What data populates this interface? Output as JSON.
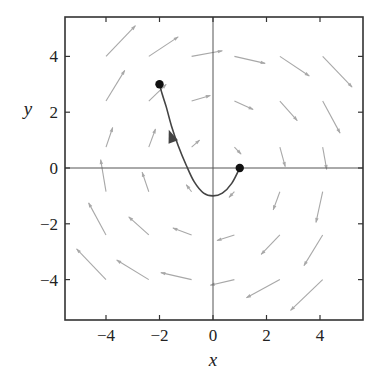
{
  "chart_data": {
    "type": "vector-field",
    "title": "",
    "xlabel": "x",
    "ylabel": "y",
    "xlim": [
      -5.4,
      5.6
    ],
    "ylim": [
      -5.4,
      5.4
    ],
    "x_ticks": [
      -4,
      -2,
      0,
      2,
      4
    ],
    "y_ticks": [
      -4,
      -2,
      0,
      2,
      4
    ],
    "x_tick_labels": [
      "−4",
      "−2",
      "0",
      "2",
      "4"
    ],
    "y_tick_labels": [
      "−4",
      "−2",
      "0",
      "2",
      "4"
    ],
    "grid": false,
    "axes_lines": true,
    "colors": {
      "frame": "#333333",
      "axes": "#555555",
      "field_arrows": "#a8a8a8",
      "trajectory": "#444444",
      "points": "#111111",
      "trajectory_arrowhead": "#444444"
    },
    "field_arrows": [
      {
        "x0": -4.0,
        "y0": 4.0,
        "x1": -2.9,
        "y1": 5.1
      },
      {
        "x0": -2.4,
        "y0": 4.0,
        "x1": -1.3,
        "y1": 4.7
      },
      {
        "x0": -0.8,
        "y0": 4.0,
        "x1": 0.35,
        "y1": 4.2
      },
      {
        "x0": 0.8,
        "y0": 4.0,
        "x1": 1.95,
        "y1": 3.75
      },
      {
        "x0": 2.5,
        "y0": 4.0,
        "x1": 3.6,
        "y1": 3.3
      },
      {
        "x0": 4.1,
        "y0": 4.0,
        "x1": 5.2,
        "y1": 2.9
      },
      {
        "x0": -4.0,
        "y0": 2.4,
        "x1": -3.3,
        "y1": 3.5
      },
      {
        "x0": -2.4,
        "y0": 2.4,
        "x1": -1.75,
        "y1": 3.0
      },
      {
        "x0": -0.8,
        "y0": 2.4,
        "x1": -0.1,
        "y1": 2.6
      },
      {
        "x0": 0.8,
        "y0": 2.4,
        "x1": 1.5,
        "y1": 2.1
      },
      {
        "x0": 2.5,
        "y0": 2.4,
        "x1": 3.15,
        "y1": 1.7
      },
      {
        "x0": 4.1,
        "y0": 2.4,
        "x1": 4.75,
        "y1": 1.25
      },
      {
        "x0": -4.0,
        "y0": 0.75,
        "x1": -3.75,
        "y1": 1.45
      },
      {
        "x0": -2.4,
        "y0": 0.75,
        "x1": -2.15,
        "y1": 1.4
      },
      {
        "x0": -0.8,
        "y0": 0.75,
        "x1": -0.5,
        "y1": 1.0
      },
      {
        "x0": 0.8,
        "y0": 0.75,
        "x1": 1.05,
        "y1": 0.5
      },
      {
        "x0": 2.5,
        "y0": 0.75,
        "x1": 2.7,
        "y1": 0.05
      },
      {
        "x0": 4.1,
        "y0": 0.75,
        "x1": 4.25,
        "y1": -0.05
      },
      {
        "x0": -4.0,
        "y0": -0.85,
        "x1": -4.2,
        "y1": 0.3
      },
      {
        "x0": -2.4,
        "y0": -0.85,
        "x1": -2.65,
        "y1": -0.15
      },
      {
        "x0": -0.8,
        "y0": -0.85,
        "x1": -1.0,
        "y1": -0.6
      },
      {
        "x0": 0.8,
        "y0": -0.85,
        "x1": 0.6,
        "y1": -1.05
      },
      {
        "x0": 2.5,
        "y0": -0.85,
        "x1": 2.25,
        "y1": -1.5
      },
      {
        "x0": 4.1,
        "y0": -0.85,
        "x1": 3.85,
        "y1": -1.95
      },
      {
        "x0": -4.0,
        "y0": -2.4,
        "x1": -4.65,
        "y1": -1.25
      },
      {
        "x0": -2.4,
        "y0": -2.4,
        "x1": -3.15,
        "y1": -1.75
      },
      {
        "x0": -0.8,
        "y0": -2.4,
        "x1": -1.5,
        "y1": -2.15
      },
      {
        "x0": 0.8,
        "y0": -2.4,
        "x1": 0.15,
        "y1": -2.6
      },
      {
        "x0": 2.5,
        "y0": -2.4,
        "x1": 1.8,
        "y1": -3.1
      },
      {
        "x0": 4.1,
        "y0": -2.4,
        "x1": 3.4,
        "y1": -3.5
      },
      {
        "x0": -4.0,
        "y0": -4.0,
        "x1": -5.1,
        "y1": -2.9
      },
      {
        "x0": -2.4,
        "y0": -4.0,
        "x1": -3.6,
        "y1": -3.3
      },
      {
        "x0": -0.8,
        "y0": -4.0,
        "x1": -1.95,
        "y1": -3.75
      },
      {
        "x0": 0.8,
        "y0": -4.0,
        "x1": -0.1,
        "y1": -4.2
      },
      {
        "x0": 2.5,
        "y0": -4.0,
        "x1": 1.25,
        "y1": -4.65
      },
      {
        "x0": 4.1,
        "y0": -4.0,
        "x1": 2.9,
        "y1": -5.1
      }
    ],
    "trajectory": {
      "points": [
        [
          1.0,
          0.0
        ],
        [
          0.7,
          -0.55
        ],
        [
          0.35,
          -0.9
        ],
        [
          0.0,
          -1.0
        ],
        [
          -0.35,
          -0.9
        ],
        [
          -0.7,
          -0.5
        ],
        [
          -1.0,
          0.1
        ],
        [
          -1.3,
          0.8
        ],
        [
          -1.55,
          1.5
        ],
        [
          -1.75,
          2.2
        ],
        [
          -1.9,
          2.65
        ],
        [
          -2.0,
          3.0
        ]
      ],
      "start": [
        1.0,
        0.0
      ],
      "end": [
        -2.0,
        3.0
      ],
      "arrowhead_at": [
        -1.55,
        1.1
      ],
      "direction": "from (1,0) toward (-2,3)"
    },
    "marked_points": [
      {
        "x": -2,
        "y": 3
      },
      {
        "x": 1,
        "y": 0
      }
    ]
  }
}
